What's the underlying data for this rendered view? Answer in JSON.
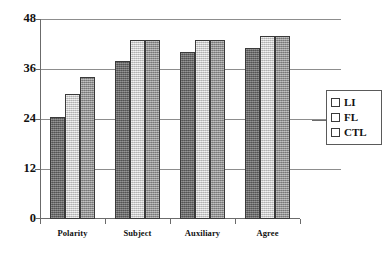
{
  "chart_data": {
    "type": "bar",
    "title": "",
    "subtitle": "",
    "xlabel": "",
    "ylabel": "",
    "categories": [
      "Polarity",
      "Subject",
      "Auxiliary",
      "Agree"
    ],
    "series": [
      {
        "name": "LI",
        "color": "#6e6e6e",
        "values": [
          24.5,
          38.0,
          40.0,
          41.0
        ]
      },
      {
        "name": "FL",
        "color": "#dcdcdc",
        "values": [
          30.0,
          43.0,
          43.0,
          44.0
        ]
      },
      {
        "name": "CTL",
        "color": "#9a9a9a",
        "values": [
          34.0,
          43.0,
          43.0,
          44.0
        ]
      }
    ],
    "ylim": [
      0,
      48
    ],
    "yticks": [
      0,
      12,
      24,
      36,
      48
    ],
    "ytick_labels": [
      "0",
      "12",
      "24",
      "36",
      "48"
    ],
    "grid": true,
    "grid_axis": "y",
    "legend": {
      "position": "right",
      "entries": [
        "LI",
        "FL",
        "CTL"
      ]
    },
    "annotations": []
  },
  "axes": {
    "y": {
      "ticks": [
        {
          "label": "48",
          "value": 48
        },
        {
          "label": "36",
          "value": 36
        },
        {
          "label": "24",
          "value": 24
        },
        {
          "label": "12",
          "value": 12
        },
        {
          "label": "0",
          "value": 0
        }
      ]
    },
    "x": {
      "ticks": [
        {
          "label": "Polarity"
        },
        {
          "label": "Subject"
        },
        {
          "label": "Auxiliary"
        },
        {
          "label": "Agree"
        }
      ]
    }
  },
  "legend": {
    "entries": [
      {
        "label": "LI",
        "swatch": "series-0-swatch"
      },
      {
        "label": "FL",
        "swatch": "series-1-swatch"
      },
      {
        "label": "CTL",
        "swatch": "series-2-swatch"
      }
    ]
  }
}
